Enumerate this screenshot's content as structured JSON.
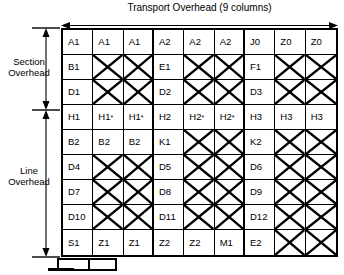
{
  "diagram": {
    "title": "Transport Overhead (9 columns)",
    "columns": 9,
    "rows": 9,
    "left_labels": {
      "section": "Section\nOverhead",
      "section_line1": "Section",
      "section_line2": "Overhead",
      "line_line1": "Line",
      "line_line2": "Overhead",
      "section_rows": [
        1,
        3
      ],
      "line_rows": [
        4,
        9
      ]
    },
    "group_separators_after_columns": [
      3,
      6
    ],
    "colors": {
      "stroke": "#000000",
      "background": "#ffffff"
    },
    "grid": [
      {
        "row": 1,
        "group": "section",
        "cells": [
          {
            "label": "A1",
            "x": false
          },
          {
            "label": "A1",
            "x": false
          },
          {
            "label": "A1",
            "x": false
          },
          {
            "label": "A2",
            "x": false
          },
          {
            "label": "A2",
            "x": false
          },
          {
            "label": "A2",
            "x": false
          },
          {
            "label": "J0",
            "x": false
          },
          {
            "label": "Z0",
            "x": false
          },
          {
            "label": "Z0",
            "x": false
          }
        ]
      },
      {
        "row": 2,
        "group": "section",
        "cells": [
          {
            "label": "B1",
            "x": false
          },
          {
            "label": "",
            "x": true
          },
          {
            "label": "",
            "x": true
          },
          {
            "label": "E1",
            "x": false
          },
          {
            "label": "",
            "x": true
          },
          {
            "label": "",
            "x": true
          },
          {
            "label": "F1",
            "x": false
          },
          {
            "label": "",
            "x": true
          },
          {
            "label": "",
            "x": true
          }
        ]
      },
      {
        "row": 3,
        "group": "section",
        "cells": [
          {
            "label": "D1",
            "x": false
          },
          {
            "label": "",
            "x": true
          },
          {
            "label": "",
            "x": true
          },
          {
            "label": "D2",
            "x": false
          },
          {
            "label": "",
            "x": true
          },
          {
            "label": "",
            "x": true
          },
          {
            "label": "D3",
            "x": false
          },
          {
            "label": "",
            "x": true
          },
          {
            "label": "",
            "x": true
          }
        ]
      },
      {
        "row": 4,
        "group": "line",
        "cells": [
          {
            "label": "H1",
            "x": false
          },
          {
            "label": "H1",
            "sup": "*",
            "x": false
          },
          {
            "label": "H1",
            "sup": "*",
            "x": false
          },
          {
            "label": "H2",
            "x": false
          },
          {
            "label": "H2",
            "sup": "*",
            "x": false
          },
          {
            "label": "H2",
            "sup": "*",
            "x": false
          },
          {
            "label": "H3",
            "x": false
          },
          {
            "label": "H3",
            "x": false
          },
          {
            "label": "H3",
            "x": false
          }
        ]
      },
      {
        "row": 5,
        "group": "line",
        "cells": [
          {
            "label": "B2",
            "x": false
          },
          {
            "label": "B2",
            "x": false
          },
          {
            "label": "B2",
            "x": false
          },
          {
            "label": "K1",
            "x": false
          },
          {
            "label": "",
            "x": true
          },
          {
            "label": "",
            "x": true
          },
          {
            "label": "K2",
            "x": false
          },
          {
            "label": "",
            "x": true
          },
          {
            "label": "",
            "x": true
          }
        ]
      },
      {
        "row": 6,
        "group": "line",
        "cells": [
          {
            "label": "D4",
            "x": false
          },
          {
            "label": "",
            "x": true
          },
          {
            "label": "",
            "x": true
          },
          {
            "label": "D5",
            "x": false
          },
          {
            "label": "",
            "x": true
          },
          {
            "label": "",
            "x": true
          },
          {
            "label": "D6",
            "x": false
          },
          {
            "label": "",
            "x": true
          },
          {
            "label": "",
            "x": true
          }
        ]
      },
      {
        "row": 7,
        "group": "line",
        "cells": [
          {
            "label": "D7",
            "x": false
          },
          {
            "label": "",
            "x": true
          },
          {
            "label": "",
            "x": true
          },
          {
            "label": "D8",
            "x": false
          },
          {
            "label": "",
            "x": true
          },
          {
            "label": "",
            "x": true
          },
          {
            "label": "D9",
            "x": false
          },
          {
            "label": "",
            "x": true
          },
          {
            "label": "",
            "x": true
          }
        ]
      },
      {
        "row": 8,
        "group": "line",
        "cells": [
          {
            "label": "D10",
            "x": false
          },
          {
            "label": "",
            "x": true
          },
          {
            "label": "",
            "x": true
          },
          {
            "label": "D11",
            "x": false
          },
          {
            "label": "",
            "x": true
          },
          {
            "label": "",
            "x": true
          },
          {
            "label": "D12",
            "x": false
          },
          {
            "label": "",
            "x": true
          },
          {
            "label": "",
            "x": true
          }
        ]
      },
      {
        "row": 9,
        "group": "line",
        "cells": [
          {
            "label": "S1",
            "x": false
          },
          {
            "label": "Z1",
            "x": false
          },
          {
            "label": "Z1",
            "x": false
          },
          {
            "label": "Z2",
            "x": false
          },
          {
            "label": "Z2",
            "x": false
          },
          {
            "label": "M1",
            "x": false
          },
          {
            "label": "E2",
            "x": false
          },
          {
            "label": "",
            "x": true
          },
          {
            "label": "",
            "x": true
          }
        ]
      }
    ]
  }
}
